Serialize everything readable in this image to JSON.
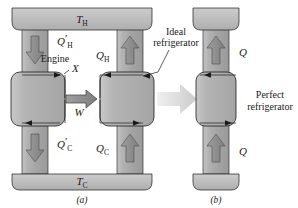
{
  "figure": {
    "background_color": "#ffffff",
    "reservoir_color": "#bdbdbd",
    "column_color": "#a9a9a9",
    "box_color": "#b0b0b0",
    "arrow_fill": "#8c8c8c",
    "outline_color": "#1a1a1a",
    "transition_arrow_color": "#d6d6d6"
  },
  "panel_a": {
    "caption": "(a)",
    "hot_reservoir_label": "T",
    "hot_reservoir_sub": "H",
    "cold_reservoir_label": "T",
    "cold_reservoir_sub": "C",
    "engine_label": "Engine",
    "engine_name": "X",
    "work_label": "W",
    "flows": [
      {
        "name": "q-prime-h",
        "symbol": "Q",
        "prime": "′",
        "sub": "H",
        "direction": "down"
      },
      {
        "name": "q-h",
        "symbol": "Q",
        "prime": "",
        "sub": "H",
        "direction": "up"
      },
      {
        "name": "q-prime-c",
        "symbol": "Q",
        "prime": "′",
        "sub": "C",
        "direction": "down"
      },
      {
        "name": "q-c",
        "symbol": "Q",
        "prime": "",
        "sub": "C",
        "direction": "up"
      }
    ],
    "callout": {
      "line1": "Ideal",
      "line2": "refrigerator"
    }
  },
  "panel_b": {
    "caption": "(b)",
    "device": {
      "line1": "Perfect",
      "line2": "refrigerator"
    },
    "flows": [
      {
        "name": "q-top",
        "symbol": "Q",
        "direction": "up"
      },
      {
        "name": "q-bottom",
        "symbol": "Q",
        "direction": "up"
      }
    ]
  }
}
